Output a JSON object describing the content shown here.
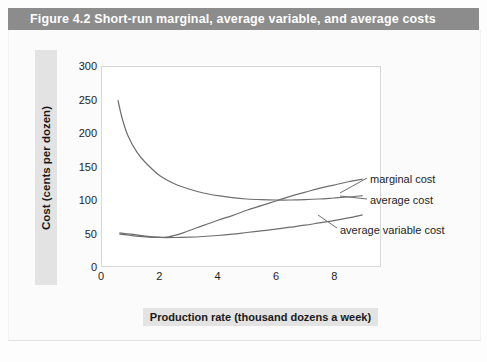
{
  "figure": {
    "title": "Figure 4.2  Short-run marginal, average variable, and average costs",
    "title_bar_color": "#8c8c8c",
    "title_text_color": "#ffffff",
    "band_color": "#e3e3e3",
    "curve_color": "#6e6e6e",
    "plot_background": "#ffffff",
    "page_background": "#fbfbfb"
  },
  "chart_data": {
    "type": "line",
    "title": "Short-run marginal, average variable, and average costs",
    "xlabel": "Production rate (thousand dozens a week)",
    "ylabel": "Cost (cents per dozen)",
    "xlim": [
      0,
      9.6
    ],
    "ylim": [
      0,
      300
    ],
    "xticks": [
      0,
      2,
      4,
      6,
      8
    ],
    "yticks": [
      0,
      50,
      100,
      150,
      200,
      250,
      300
    ],
    "grid": false,
    "legend": "inline-annotations-right",
    "series": [
      {
        "name": "average cost",
        "label": "average cost",
        "x": [
          0.55,
          0.7,
          0.9,
          1.2,
          1.5,
          2.0,
          2.5,
          3.0,
          3.5,
          4.0,
          4.5,
          5.0,
          5.5,
          6.0,
          6.5,
          7.0,
          7.5,
          8.0,
          8.5,
          9.0
        ],
        "y": [
          250,
          222,
          196,
          172,
          156,
          136,
          124,
          116,
          110,
          106,
          103,
          101,
          100,
          99.5,
          99.5,
          100,
          101,
          102.5,
          104,
          106
        ]
      },
      {
        "name": "marginal cost",
        "label": "marginal cost",
        "x": [
          0.6,
          1.0,
          1.5,
          2.0,
          2.3,
          2.8,
          3.3,
          4.0,
          4.5,
          5.0,
          5.5,
          6.0,
          6.5,
          7.0,
          7.5,
          8.0,
          8.5,
          9.0
        ],
        "y": [
          50,
          48,
          45,
          43.5,
          44,
          50,
          58,
          69,
          76,
          84,
          91,
          98,
          105,
          111,
          117,
          122,
          127,
          131
        ]
      },
      {
        "name": "average variable cost",
        "label": "average variable cost",
        "x": [
          0.6,
          1.0,
          1.5,
          2.0,
          2.5,
          3.0,
          3.5,
          4.0,
          4.5,
          5.0,
          5.5,
          6.0,
          6.5,
          7.0,
          7.5,
          8.0,
          8.5,
          9.0
        ],
        "y": [
          48,
          46,
          44,
          43,
          43,
          43.5,
          44.5,
          46,
          48,
          50.5,
          53,
          55.5,
          58.5,
          61.5,
          65,
          68.5,
          72.5,
          77
        ]
      }
    ]
  },
  "bleed_text": "cut-off text"
}
